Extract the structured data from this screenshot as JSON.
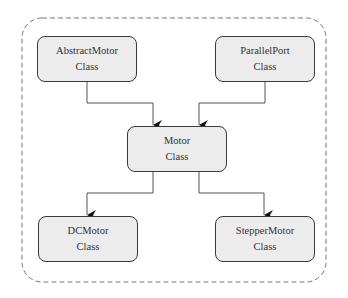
{
  "diagram": {
    "type": "class-hierarchy",
    "container": {
      "style": "dashed rounded rectangle"
    },
    "nodes": [
      {
        "id": "abstract_motor",
        "line1": "AbstractMotor",
        "line2": "Class"
      },
      {
        "id": "parallel_port",
        "line1": "ParallelPort",
        "line2": "Class"
      },
      {
        "id": "motor",
        "line1": "Motor",
        "line2": "Class"
      },
      {
        "id": "dc_motor",
        "line1": "DCMotor",
        "line2": "Class"
      },
      {
        "id": "stepper_motor",
        "line1": "StepperMotor",
        "line2": "Class"
      }
    ],
    "edges": [
      {
        "from": "abstract_motor",
        "to": "motor"
      },
      {
        "from": "parallel_port",
        "to": "motor"
      },
      {
        "from": "motor",
        "to": "dc_motor"
      },
      {
        "from": "motor",
        "to": "stepper_motor"
      }
    ],
    "colors": {
      "node_fill": "#ececec",
      "stroke": "#3a3a3a",
      "container_stroke": "#777777"
    }
  }
}
